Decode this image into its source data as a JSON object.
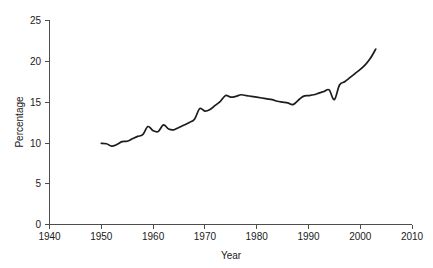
{
  "chart_data": {
    "type": "line",
    "title": "",
    "xlabel": "Year",
    "ylabel": "Percentage",
    "xlim": [
      1940,
      2010
    ],
    "ylim": [
      0,
      25
    ],
    "xticks": [
      1940,
      1950,
      1960,
      1970,
      1980,
      1990,
      2000,
      2010
    ],
    "yticks": [
      0,
      5,
      10,
      15,
      20,
      25
    ],
    "grid": false,
    "legend": null,
    "line_color": "#1c1c1c",
    "axis_color": "#4d4d4d",
    "background_color": "#ffffff",
    "x": [
      1950,
      1951,
      1952,
      1953,
      1954,
      1955,
      1956,
      1957,
      1958,
      1959,
      1960,
      1961,
      1962,
      1963,
      1964,
      1965,
      1966,
      1967,
      1968,
      1969,
      1970,
      1971,
      1972,
      1973,
      1974,
      1975,
      1976,
      1977,
      1978,
      1979,
      1980,
      1981,
      1982,
      1983,
      1984,
      1985,
      1986,
      1987,
      1988,
      1989,
      1990,
      1991,
      1992,
      1993,
      1994,
      1995,
      1996,
      1997,
      1998,
      1999,
      2000,
      2001,
      2002,
      2003
    ],
    "values": [
      9.95,
      9.9,
      9.6,
      9.8,
      10.15,
      10.2,
      10.5,
      10.8,
      11.0,
      12.0,
      11.5,
      11.4,
      12.2,
      11.7,
      11.6,
      11.9,
      12.2,
      12.5,
      12.9,
      14.2,
      13.9,
      14.1,
      14.6,
      15.1,
      15.8,
      15.6,
      15.7,
      15.9,
      15.8,
      15.7,
      15.6,
      15.5,
      15.4,
      15.3,
      15.1,
      15.0,
      14.9,
      14.7,
      15.2,
      15.7,
      15.8,
      15.9,
      16.1,
      16.3,
      16.5,
      15.3,
      17.1,
      17.5,
      18.0,
      18.5,
      19.0,
      19.6,
      20.4,
      21.5
    ],
    "series": [
      {
        "name": "Percentage",
        "values": [
          9.95,
          9.9,
          9.6,
          9.8,
          10.15,
          10.2,
          10.5,
          10.8,
          11.0,
          12.0,
          11.5,
          11.4,
          12.2,
          11.7,
          11.6,
          11.9,
          12.2,
          12.5,
          12.9,
          14.2,
          13.9,
          14.1,
          14.6,
          15.1,
          15.8,
          15.6,
          15.7,
          15.9,
          15.8,
          15.7,
          15.6,
          15.5,
          15.4,
          15.3,
          15.1,
          15.0,
          14.9,
          14.7,
          15.2,
          15.7,
          15.8,
          15.9,
          16.1,
          16.3,
          16.5,
          15.3,
          17.1,
          17.5,
          18.0,
          18.5,
          19.0,
          19.6,
          20.4,
          21.5
        ]
      }
    ]
  },
  "axes": {
    "x_tick_labels": [
      "1940",
      "1950",
      "1960",
      "1970",
      "1980",
      "1990",
      "2000",
      "2010"
    ],
    "y_tick_labels": [
      "0",
      "5",
      "10",
      "15",
      "20",
      "25"
    ],
    "x_title": "Year",
    "y_title": "Percentage"
  }
}
